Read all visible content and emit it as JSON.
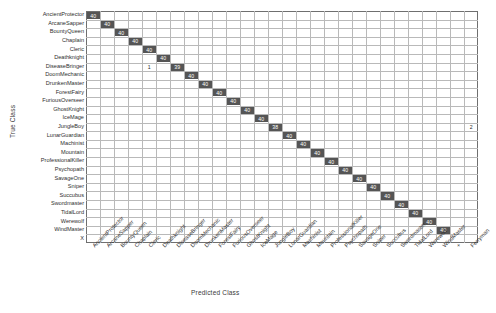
{
  "chart_data": {
    "type": "heatmap",
    "title": "",
    "xlabel": "Predicted Class",
    "ylabel": "True Class",
    "grid": true,
    "legend": "none",
    "colormap": {
      "low": "#ffffff",
      "high": "#555555",
      "text_on_high": "#ffffff",
      "text_on_low": "#2a2a2a"
    },
    "row_categories": [
      "AncientProtector",
      "ArcaneSapper",
      "BountyQueen",
      "Chaplain",
      "Cleric",
      "Deathknight",
      "DiseaseBringer",
      "DoomMechanic",
      "DrunkenMaster",
      "ForestFairy",
      "FuriousOverseer",
      "GhostKnight",
      "IceMage",
      "JungleBoy",
      "LunarGuardian",
      "Machinist",
      "Mountain",
      "ProfessionalKiller",
      "Psychopath",
      "SavageOne",
      "Sniper",
      "Succubus",
      "Swordmaster",
      "TidalLord",
      "Werewolf",
      "WindMaster",
      "X"
    ],
    "column_categories": [
      "AncientProtector",
      "ArcaneSapper",
      "BountyQueen",
      "Chaplain",
      "Cleric",
      "Deathknight",
      "DiseaseBringer",
      "DoomMechanic",
      "DrunkenMaster",
      "ForestFairy",
      "FuriousOverseer",
      "GhostKnight",
      "IceMage",
      "JungleBoy",
      "LunarGuardian",
      "Machinist",
      "Mountain",
      "ProfessionalKiller",
      "Psychopath",
      "SavageOne",
      "Sniper",
      "Succubus",
      "Swordmaster",
      "TidalLord",
      "Werewolf",
      "WindMaster",
      "+",
      "Ferryman"
    ],
    "cells": [
      {
        "row": 0,
        "col": 0,
        "value": 40,
        "filled": true
      },
      {
        "row": 1,
        "col": 1,
        "value": 40,
        "filled": true
      },
      {
        "row": 2,
        "col": 2,
        "value": 40,
        "filled": true
      },
      {
        "row": 3,
        "col": 3,
        "value": 40,
        "filled": true
      },
      {
        "row": 4,
        "col": 4,
        "value": 40,
        "filled": true
      },
      {
        "row": 5,
        "col": 5,
        "value": 40,
        "filled": true
      },
      {
        "row": 6,
        "col": 4,
        "value": 1,
        "filled": false
      },
      {
        "row": 6,
        "col": 6,
        "value": 39,
        "filled": true
      },
      {
        "row": 7,
        "col": 7,
        "value": 40,
        "filled": true
      },
      {
        "row": 8,
        "col": 8,
        "value": 40,
        "filled": true
      },
      {
        "row": 9,
        "col": 9,
        "value": 40,
        "filled": true
      },
      {
        "row": 10,
        "col": 10,
        "value": 40,
        "filled": true
      },
      {
        "row": 11,
        "col": 11,
        "value": 40,
        "filled": true
      },
      {
        "row": 12,
        "col": 12,
        "value": 40,
        "filled": true
      },
      {
        "row": 13,
        "col": 13,
        "value": 38,
        "filled": true
      },
      {
        "row": 13,
        "col": 27,
        "value": 2,
        "filled": false
      },
      {
        "row": 14,
        "col": 14,
        "value": 40,
        "filled": true
      },
      {
        "row": 15,
        "col": 15,
        "value": 40,
        "filled": true
      },
      {
        "row": 16,
        "col": 16,
        "value": 40,
        "filled": true
      },
      {
        "row": 17,
        "col": 17,
        "value": 40,
        "filled": true
      },
      {
        "row": 18,
        "col": 18,
        "value": 40,
        "filled": true
      },
      {
        "row": 19,
        "col": 19,
        "value": 40,
        "filled": true
      },
      {
        "row": 20,
        "col": 20,
        "value": 40,
        "filled": true
      },
      {
        "row": 21,
        "col": 21,
        "value": 40,
        "filled": true
      },
      {
        "row": 22,
        "col": 22,
        "value": 40,
        "filled": true
      },
      {
        "row": 23,
        "col": 23,
        "value": 40,
        "filled": true
      },
      {
        "row": 24,
        "col": 24,
        "value": 40,
        "filled": true
      },
      {
        "row": 25,
        "col": 25,
        "value": 40,
        "filled": true
      }
    ]
  }
}
